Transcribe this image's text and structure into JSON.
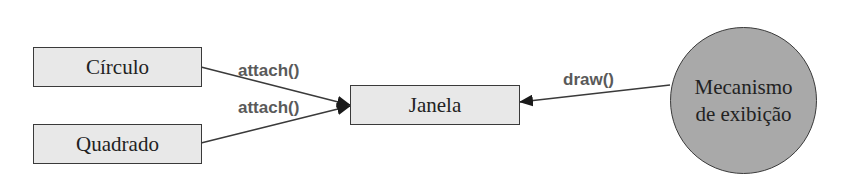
{
  "diagram": {
    "nodes": {
      "circulo": {
        "label": "Círculo",
        "shape": "rectangle"
      },
      "quadrado": {
        "label": "Quadrado",
        "shape": "rectangle"
      },
      "janela": {
        "label": "Janela",
        "shape": "rectangle"
      },
      "mecanismo": {
        "line1": "Mecanismo",
        "line2": "de exibição",
        "shape": "circle"
      }
    },
    "edges": [
      {
        "from": "Círculo",
        "to": "Janela",
        "label": "attach()"
      },
      {
        "from": "Quadrado",
        "to": "Janela",
        "label": "attach()"
      },
      {
        "from": "Mecanismo de exibição",
        "to": "Janela",
        "label": "draw()"
      }
    ],
    "colors": {
      "box_fill": "#e8e8e8",
      "circle_fill": "#a9a9a9",
      "stroke": "#3a3a3a",
      "edge_label": "#5a5a5a"
    }
  }
}
